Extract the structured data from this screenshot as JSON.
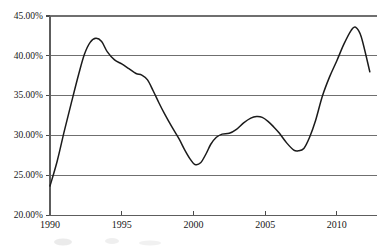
{
  "chart_data": {
    "type": "line",
    "title": "",
    "subtitle": "",
    "xlabel": "",
    "ylabel": "",
    "xlim": [
      1990,
      2012.3
    ],
    "ylim": [
      20,
      45
    ],
    "grid": true,
    "legend": false,
    "legend_position": "none",
    "y_tick_labels": [
      "45.00%",
      "40.00%",
      "35.00%",
      "30.00%",
      "25.00%",
      "20.00%"
    ],
    "y_tick_values": [
      45,
      40,
      35,
      30,
      25,
      20
    ],
    "x_tick_labels": [
      "1990",
      "1995",
      "2000",
      "2005",
      "2010"
    ],
    "x_tick_values": [
      1990,
      1995,
      2000,
      2005,
      2010
    ],
    "series": [
      {
        "name": "series-1",
        "color": "#1b1b1b",
        "x": [
          1990,
          1990.5,
          1991,
          1991.5,
          1992,
          1992.4,
          1992.8,
          1993.2,
          1993.6,
          1994,
          1994.5,
          1995,
          1995.5,
          1996,
          1996.4,
          1996.8,
          1997.2,
          1997.6,
          1998,
          1998.5,
          1999,
          1999.4,
          1999.8,
          2000.1,
          2000.5,
          2000.9,
          2001.2,
          2001.6,
          2002,
          2002.5,
          2003,
          2003.5,
          2004,
          2004.4,
          2004.8,
          2005.2,
          2005.6,
          2006,
          2006.5,
          2007,
          2007.3,
          2007.7,
          2008.1,
          2008.5,
          2009,
          2009.5,
          2010,
          2010.5,
          2011,
          2011.3,
          2011.7,
          2012.3
        ],
        "y": [
          23.7,
          26.8,
          30.6,
          34.2,
          37.7,
          40.2,
          41.7,
          42.2,
          41.8,
          40.5,
          39.5,
          39.0,
          38.4,
          37.8,
          37.6,
          37.0,
          35.6,
          34.1,
          32.7,
          31.1,
          29.6,
          28.2,
          27.0,
          26.4,
          26.6,
          27.8,
          28.9,
          29.8,
          30.2,
          30.3,
          30.8,
          31.6,
          32.2,
          32.4,
          32.3,
          31.8,
          31.1,
          30.3,
          29.1,
          28.2,
          28.1,
          28.4,
          29.8,
          31.8,
          35.0,
          37.4,
          39.4,
          41.5,
          43.2,
          43.6,
          42.4,
          38.0
        ]
      }
    ],
    "annotations": [],
    "key_points": {
      "start_1990": 23.7,
      "peak_1993": 42.2,
      "trough_2000": 26.4,
      "local_max_2004": 32.4,
      "local_min_2007": 28.1,
      "peak_2011": 43.6,
      "end_2012": 38.0
    }
  },
  "colors": {
    "line": "#1b1b1b",
    "gridline": "#6f6f6f",
    "axis": "#5d5d5d",
    "text": "#171717",
    "background": "#ffffff"
  }
}
